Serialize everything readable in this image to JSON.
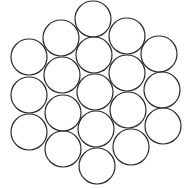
{
  "diagram": {
    "stroke_color": "#2a2a2a",
    "background": "#ffffff",
    "radius": 18,
    "circles": [
      {
        "cx": 29,
        "cy": 57
      },
      {
        "cx": 29,
        "cy": 95
      },
      {
        "cx": 29,
        "cy": 132
      },
      {
        "cx": 61,
        "cy": 38
      },
      {
        "cx": 62,
        "cy": 75
      },
      {
        "cx": 63,
        "cy": 113
      },
      {
        "cx": 63,
        "cy": 149
      },
      {
        "cx": 93,
        "cy": 19
      },
      {
        "cx": 94,
        "cy": 55
      },
      {
        "cx": 95,
        "cy": 92
      },
      {
        "cx": 96,
        "cy": 129
      },
      {
        "cx": 97,
        "cy": 166
      },
      {
        "cx": 127,
        "cy": 36
      },
      {
        "cx": 127,
        "cy": 73
      },
      {
        "cx": 128,
        "cy": 110
      },
      {
        "cx": 131,
        "cy": 147
      },
      {
        "cx": 159,
        "cy": 54
      },
      {
        "cx": 162,
        "cy": 90
      },
      {
        "cx": 163,
        "cy": 126
      }
    ]
  }
}
